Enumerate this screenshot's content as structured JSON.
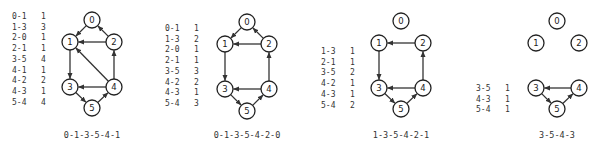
{
  "figure": {
    "node_radius": 8,
    "colors": {
      "stroke": "#222222",
      "edge": "#333333",
      "text": "#333333",
      "background": "#ffffff"
    },
    "panels": [
      {
        "caption": "0-1-3-5-4-1",
        "caption_pos": [
          92,
          138
        ],
        "table_pos": [
          12,
          19
        ],
        "weight_x": 41,
        "row_spacing": 10.7,
        "table": [
          {
            "edge": "0-1",
            "weight": "1"
          },
          {
            "edge": "1-3",
            "weight": "3"
          },
          {
            "edge": "2-0",
            "weight": "1"
          },
          {
            "edge": "2-1",
            "weight": "1"
          },
          {
            "edge": "3-5",
            "weight": "4"
          },
          {
            "edge": "4-1",
            "weight": "1"
          },
          {
            "edge": "4-2",
            "weight": "2"
          },
          {
            "edge": "4-3",
            "weight": "1"
          },
          {
            "edge": "5-4",
            "weight": "4"
          }
        ],
        "nodes": [
          {
            "id": "0",
            "x": 92,
            "y": 20
          },
          {
            "id": "1",
            "x": 70,
            "y": 42
          },
          {
            "id": "2",
            "x": 114,
            "y": 42
          },
          {
            "id": "3",
            "x": 70,
            "y": 87
          },
          {
            "id": "4",
            "x": 114,
            "y": 87
          },
          {
            "id": "5",
            "x": 92,
            "y": 108
          }
        ],
        "edges": [
          [
            0,
            1
          ],
          [
            1,
            3
          ],
          [
            2,
            0
          ],
          [
            2,
            1
          ],
          [
            3,
            5
          ],
          [
            4,
            1
          ],
          [
            4,
            2
          ],
          [
            4,
            3
          ],
          [
            5,
            4
          ]
        ]
      },
      {
        "caption": "0-1-3-5-4-2-0",
        "caption_pos": [
          247,
          138
        ],
        "table_pos": [
          165,
          31
        ],
        "weight_x": 194,
        "row_spacing": 10.7,
        "table": [
          {
            "edge": "0-1",
            "weight": "1"
          },
          {
            "edge": "1-3",
            "weight": "2"
          },
          {
            "edge": "2-0",
            "weight": "1"
          },
          {
            "edge": "2-1",
            "weight": "1"
          },
          {
            "edge": "3-5",
            "weight": "3"
          },
          {
            "edge": "4-2",
            "weight": "2"
          },
          {
            "edge": "4-3",
            "weight": "1"
          },
          {
            "edge": "5-4",
            "weight": "3"
          }
        ],
        "nodes": [
          {
            "id": "0",
            "x": 247,
            "y": 22
          },
          {
            "id": "1",
            "x": 225,
            "y": 44
          },
          {
            "id": "2",
            "x": 269,
            "y": 44
          },
          {
            "id": "3",
            "x": 225,
            "y": 89
          },
          {
            "id": "4",
            "x": 269,
            "y": 89
          },
          {
            "id": "5",
            "x": 247,
            "y": 111
          }
        ],
        "edges": [
          [
            0,
            1
          ],
          [
            1,
            3
          ],
          [
            2,
            0
          ],
          [
            2,
            1
          ],
          [
            3,
            5
          ],
          [
            4,
            2
          ],
          [
            4,
            3
          ],
          [
            5,
            4
          ]
        ]
      },
      {
        "caption": "1-3-5-4-2-1",
        "caption_pos": [
          401,
          138
        ],
        "table_pos": [
          321,
          54
        ],
        "weight_x": 350,
        "row_spacing": 10.7,
        "table": [
          {
            "edge": "1-3",
            "weight": "1"
          },
          {
            "edge": "2-1",
            "weight": "1"
          },
          {
            "edge": "3-5",
            "weight": "2"
          },
          {
            "edge": "4-2",
            "weight": "1"
          },
          {
            "edge": "4-3",
            "weight": "1"
          },
          {
            "edge": "5-4",
            "weight": "2"
          }
        ],
        "nodes": [
          {
            "id": "0",
            "x": 401,
            "y": 21
          },
          {
            "id": "1",
            "x": 379,
            "y": 43
          },
          {
            "id": "2",
            "x": 423,
            "y": 43
          },
          {
            "id": "3",
            "x": 379,
            "y": 88
          },
          {
            "id": "4",
            "x": 423,
            "y": 88
          },
          {
            "id": "5",
            "x": 401,
            "y": 109
          }
        ],
        "edges": [
          [
            1,
            3
          ],
          [
            2,
            1
          ],
          [
            3,
            5
          ],
          [
            4,
            2
          ],
          [
            4,
            3
          ],
          [
            5,
            4
          ]
        ]
      },
      {
        "caption": "3-5-4-3",
        "caption_pos": [
          557,
          138
        ],
        "table_pos": [
          476,
          91
        ],
        "weight_x": 505,
        "row_spacing": 10.7,
        "table": [
          {
            "edge": "3-5",
            "weight": "1"
          },
          {
            "edge": "4-3",
            "weight": "1"
          },
          {
            "edge": "5-4",
            "weight": "1"
          }
        ],
        "nodes": [
          {
            "id": "0",
            "x": 557,
            "y": 21
          },
          {
            "id": "1",
            "x": 536,
            "y": 43
          },
          {
            "id": "2",
            "x": 579,
            "y": 43
          },
          {
            "id": "3",
            "x": 536,
            "y": 88
          },
          {
            "id": "4",
            "x": 579,
            "y": 88
          },
          {
            "id": "5",
            "x": 557,
            "y": 109
          }
        ],
        "edges": [
          [
            3,
            5
          ],
          [
            4,
            3
          ],
          [
            5,
            4
          ]
        ]
      }
    ]
  }
}
